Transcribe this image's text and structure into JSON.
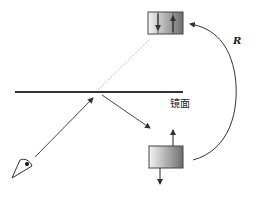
{
  "diagram": {
    "mirror_label": "镜面",
    "radius_label": "R",
    "colors": {
      "line": "#333333",
      "dotted_ray": "#bbbbbb",
      "box_light": "#f2f2f2",
      "box_dark": "#777777"
    }
  }
}
